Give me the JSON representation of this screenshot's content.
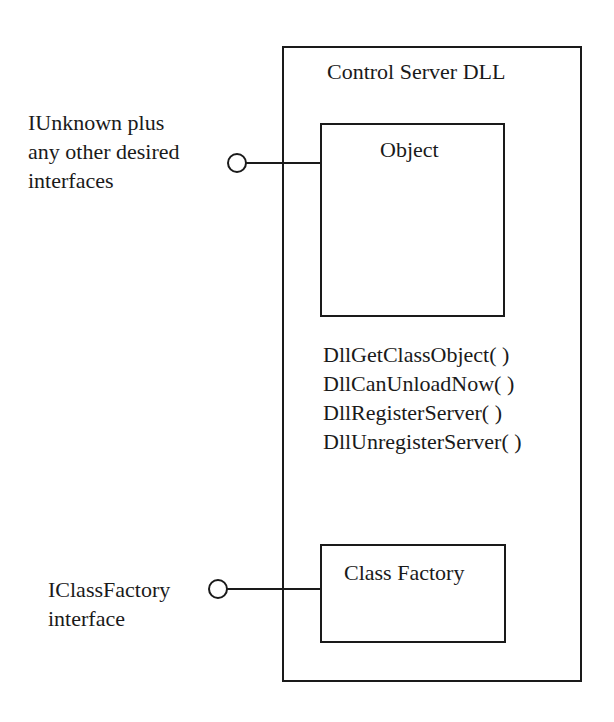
{
  "diagram": {
    "type": "component-diagram",
    "colors": {
      "stroke": "#1a1a1a",
      "background": "#ffffff",
      "text": "#1a1a1a"
    },
    "container": {
      "title": "Control Server DLL"
    },
    "object_box": {
      "label": "Object"
    },
    "exported_functions": [
      "DllGetClassObject( )",
      "DllCanUnloadNow( )",
      "DllRegisterServer( )",
      "DllUnregisterServer( )"
    ],
    "class_factory_box": {
      "label": "Class Factory"
    },
    "interfaces": [
      {
        "lines": [
          "IUnknown plus",
          "any other desired",
          "interfaces"
        ],
        "connects_to": "Object",
        "icon": "lollipop-interface-icon"
      },
      {
        "lines": [
          "IClassFactory",
          "interface"
        ],
        "connects_to": "Class Factory",
        "icon": "lollipop-interface-icon"
      }
    ]
  }
}
